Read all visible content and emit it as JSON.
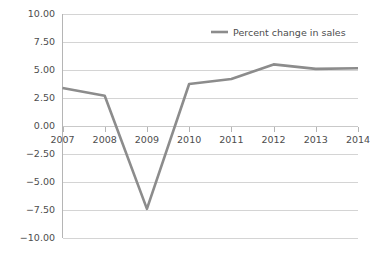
{
  "chart_data": {
    "type": "line",
    "title": "",
    "xlabel": "",
    "ylabel": "",
    "categories": [
      "2007",
      "2008",
      "2009",
      "2010",
      "2011",
      "2012",
      "2013",
      "2014"
    ],
    "series": [
      {
        "name": "Percent change in sales",
        "color": "#8c8c8c",
        "values": [
          3.4,
          2.7,
          -7.4,
          3.75,
          4.2,
          5.5,
          5.1,
          5.15
        ]
      }
    ],
    "ylim": [
      -10.0,
      10.0
    ],
    "ytick_values": [
      10.0,
      7.5,
      5.0,
      2.5,
      0.0,
      -2.5,
      -5.0,
      -7.5,
      -10.0
    ],
    "ytick_labels": [
      "10.00",
      "7.50",
      "5.00",
      "2.50",
      "0.00",
      "−2.50",
      "−5.00",
      "−7.50",
      "−10.00"
    ],
    "grid": true,
    "legend_position": "top-right",
    "legend_entries": [
      "Percent change in sales"
    ]
  },
  "style": {
    "background_color": "#ffffff",
    "grid_color": "#d4d4d4",
    "axis_color": "#b5b5b5",
    "text_color": "#4d4d4d",
    "series_color": "#8c8c8c"
  },
  "legend": {
    "label": "Percent change in sales"
  }
}
